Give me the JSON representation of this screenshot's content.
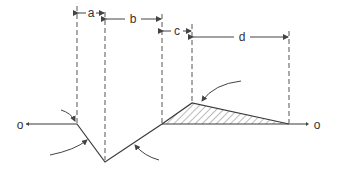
{
  "diagram": {
    "endpoints": {
      "left": "o",
      "right": "o"
    },
    "dimensions": [
      {
        "id": "a",
        "label": "a"
      },
      {
        "id": "b",
        "label": "b"
      },
      {
        "id": "c",
        "label": "c"
      },
      {
        "id": "d",
        "label": "d"
      }
    ],
    "hatched_region": "triangle between rise and baseline",
    "curved_arrows": 4,
    "colors": {
      "ink": "#3a3a3a",
      "background": "#ffffff"
    }
  }
}
